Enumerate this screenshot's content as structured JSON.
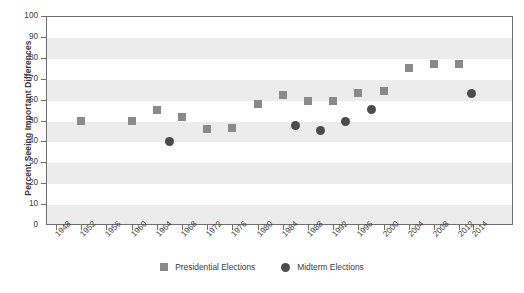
{
  "chart_data": {
    "type": "scatter",
    "title": "",
    "xlabel": "",
    "ylabel": "Percent Seeing Important Differences",
    "ylim": [
      0,
      100
    ],
    "ytick_step": 10,
    "ytick_labels": [
      "0",
      "10",
      "20",
      "30",
      "40",
      "50",
      "60",
      "70",
      "80",
      "90",
      "100"
    ],
    "xtick_labels": [
      "1948",
      "1952",
      "1956",
      "1960",
      "1964",
      "1968",
      "1972",
      "1976",
      "1980",
      "1984",
      "1988",
      "1992",
      "1996",
      "2000",
      "2004",
      "2008",
      "2012",
      "2014"
    ],
    "xlim": [
      1948,
      2014
    ],
    "grid": "horizontal-bands",
    "legend_position": "bottom-center",
    "series": [
      {
        "name": "Presidential Elections",
        "marker": "square",
        "color": "#8a8a8a",
        "points": [
          {
            "x": 1952,
            "y": 50
          },
          {
            "x": 1960,
            "y": 50
          },
          {
            "x": 1964,
            "y": 55
          },
          {
            "x": 1968,
            "y": 51.5
          },
          {
            "x": 1972,
            "y": 46
          },
          {
            "x": 1976,
            "y": 46.5
          },
          {
            "x": 1980,
            "y": 58
          },
          {
            "x": 1984,
            "y": 62
          },
          {
            "x": 1988,
            "y": 59.5
          },
          {
            "x": 1992,
            "y": 59.5
          },
          {
            "x": 1996,
            "y": 63
          },
          {
            "x": 2000,
            "y": 64
          },
          {
            "x": 2004,
            "y": 75
          },
          {
            "x": 2008,
            "y": 77
          },
          {
            "x": 2012,
            "y": 77
          }
        ]
      },
      {
        "name": "Midterm Elections",
        "marker": "circle",
        "color": "#4b4b4b",
        "points": [
          {
            "x": 1966,
            "y": 40
          },
          {
            "x": 1986,
            "y": 47.5
          },
          {
            "x": 1990,
            "y": 45
          },
          {
            "x": 1994,
            "y": 49.5
          },
          {
            "x": 1998,
            "y": 55.5
          },
          {
            "x": 2014,
            "y": 63
          }
        ]
      }
    ]
  },
  "legend": {
    "items": [
      {
        "label": "Presidential Elections",
        "marker": "square-marker-icon"
      },
      {
        "label": "Midterm Elections",
        "marker": "circle-marker-icon"
      }
    ]
  }
}
